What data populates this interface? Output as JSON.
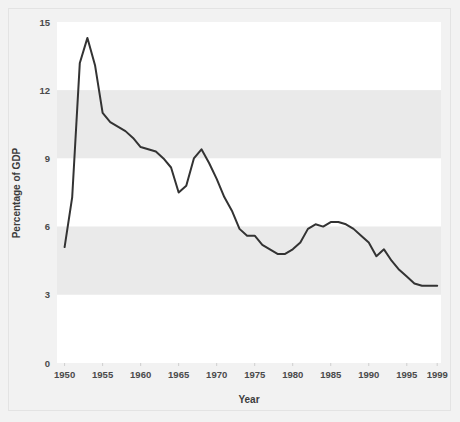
{
  "figure": {
    "background_color": "#f2f2f2",
    "frame_border_color": "#e3e3e3",
    "plot_band_light": "#ffffff",
    "plot_band_gray": "#eaeaea",
    "line_color": "#333333",
    "tick_label_color": "#4a4a4a",
    "axis_title_color": "#3c3c3c"
  },
  "chart_data": {
    "type": "line",
    "title": "",
    "xlabel": "Year",
    "ylabel": "Percentage of GDP",
    "xlim": [
      1949,
      1999.5
    ],
    "ylim": [
      0,
      15
    ],
    "xticks": [
      1950,
      1955,
      1960,
      1965,
      1970,
      1975,
      1980,
      1985,
      1990,
      1995,
      1999
    ],
    "xtick_labels": [
      "1950",
      "1955",
      "1960",
      "1965",
      "1970",
      "1975",
      "1980",
      "1985",
      "1990",
      "1995",
      "1999"
    ],
    "yticks": [
      0,
      3,
      6,
      9,
      12,
      15
    ],
    "ytick_labels": [
      "0",
      "3",
      "6",
      "9",
      "12",
      "15"
    ],
    "grid": false,
    "banded_background": true,
    "band_ranges": [
      {
        "from": 12,
        "to": 15,
        "color": "#ffffff"
      },
      {
        "from": 9,
        "to": 12,
        "color": "#eaeaea"
      },
      {
        "from": 6,
        "to": 9,
        "color": "#ffffff"
      },
      {
        "from": 3,
        "to": 6,
        "color": "#eaeaea"
      },
      {
        "from": 0,
        "to": 3,
        "color": "#ffffff"
      }
    ],
    "legend": null,
    "series": [
      {
        "name": "Percentage of GDP",
        "color": "#333333",
        "x": [
          1950,
          1951,
          1952,
          1953,
          1954,
          1955,
          1956,
          1957,
          1958,
          1959,
          1960,
          1961,
          1962,
          1963,
          1964,
          1965,
          1966,
          1967,
          1968,
          1969,
          1970,
          1971,
          1972,
          1973,
          1974,
          1975,
          1976,
          1977,
          1978,
          1979,
          1980,
          1981,
          1982,
          1983,
          1984,
          1985,
          1986,
          1987,
          1988,
          1989,
          1990,
          1991,
          1992,
          1993,
          1994,
          1995,
          1996,
          1997,
          1998,
          1999
        ],
        "y": [
          5.1,
          7.3,
          13.2,
          14.3,
          13.1,
          11.0,
          10.6,
          10.4,
          10.2,
          9.9,
          9.5,
          9.4,
          9.3,
          9.0,
          8.6,
          7.5,
          7.8,
          9.0,
          9.4,
          8.8,
          8.1,
          7.3,
          6.7,
          5.9,
          5.6,
          5.6,
          5.2,
          5.0,
          4.8,
          4.8,
          5.0,
          5.3,
          5.9,
          6.1,
          6.0,
          6.2,
          6.2,
          6.1,
          5.9,
          5.6,
          5.3,
          4.7,
          5.0,
          4.5,
          4.1,
          3.8,
          3.5,
          3.4,
          3.4,
          3.4
        ]
      }
    ]
  },
  "axes": {
    "y_axis_title": "Percentage of GDP",
    "x_axis_title": "Year"
  }
}
